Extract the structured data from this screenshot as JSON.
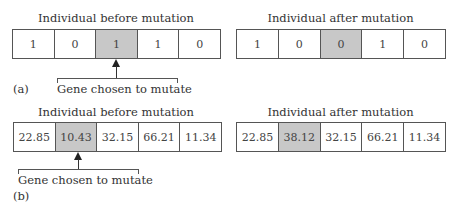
{
  "panel_a": {
    "label": "(a)",
    "before": {
      "title": "Individual before mutation",
      "genes": [
        "1",
        "0",
        "1",
        "1",
        "0"
      ],
      "highlighted_index": 2
    },
    "after": {
      "title": "Individual after mutation",
      "genes": [
        "1",
        "0",
        "0",
        "1",
        "0"
      ],
      "highlighted_index": 2
    },
    "annotation": "Gene chosen to mutate"
  },
  "panel_b": {
    "label": "(b)",
    "before": {
      "title": "Individual before mutation",
      "genes": [
        "22.85",
        "10.43",
        "32.15",
        "66.21",
        "11.34"
      ],
      "highlighted_index": 1
    },
    "after": {
      "title": "Individual after mutation",
      "genes": [
        "22.85",
        "38.12",
        "32.15",
        "66.21",
        "11.34"
      ],
      "highlighted_index": 1
    },
    "annotation": "Gene chosen to mutate"
  },
  "colors": {
    "highlight": "#c8c8c8",
    "border": "#555555",
    "text": "#333333"
  }
}
